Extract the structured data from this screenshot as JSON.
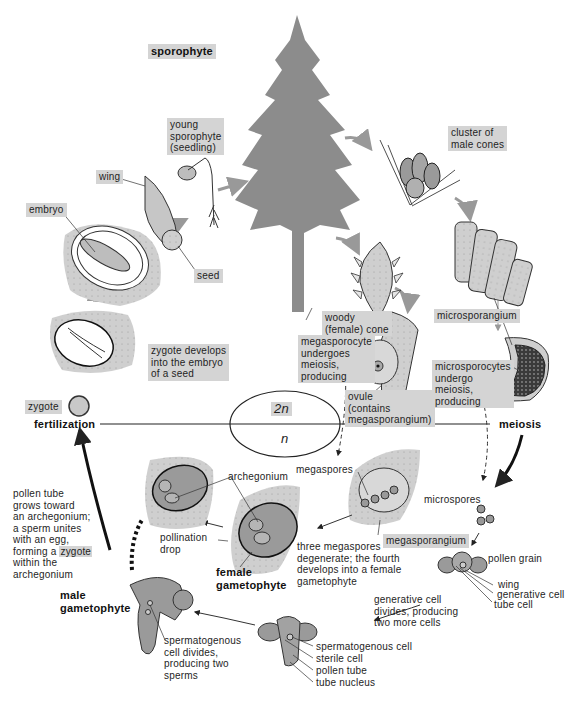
{
  "diagram": {
    "regions": {
      "diploid": "2n",
      "haploid": "n"
    },
    "stage_labels": {
      "sporophyte": "sporophyte",
      "fertilization": "fertilization",
      "meiosis": "meiosis",
      "male_gametophyte": "male\ngametophyte",
      "female_gametophyte": "female\ngametophyte"
    },
    "labels": {
      "young_sporophyte": "young\nsporophyte\n(seedling)",
      "wing_seed": "wing",
      "embryo": "embryo",
      "seed": "seed",
      "cluster_male_cones": "cluster of\nmale cones",
      "woody_cone": "woody\n(female) cone",
      "microsporangium": "microsporangium",
      "megasporocyte": "megasporocyte\nundergoes\nmeiosis,\nproducing",
      "ovule": "ovule\n(contains\nmegasporangium)",
      "microsporocytes": "microsporocytes\nundergo\nmeiosis,\nproducing",
      "zygote_develops": "zygote develops\ninto the embryo\nof a seed",
      "zygote": "zygote",
      "megaspores": "megaspores",
      "megasporangium": "megasporangium",
      "three_megaspores": "three megaspores\ndegenerate; the fourth\ndevelops into a female\ngametophyte",
      "microspores": "microspores",
      "pollen_grain": "pollen grain",
      "wing_pollen": "wing",
      "generative_cell": "generative cell",
      "tube_cell": "tube cell",
      "generative_divides": "generative cell\ndivides, producing\ntwo more cells",
      "archegonium": "archegonium",
      "pollination_drop": "pollination\ndrop",
      "pollen_tube_text_1": "pollen tube\ngrows toward\nan archegonium;\na sperm unites\nwith an egg,\nforming a ",
      "pollen_tube_zygote": "zygote",
      "pollen_tube_text_2": "\nwithin the\narchegonium",
      "spermatogenous_divides": "spermatogenous\ncell divides,\nproducing two\nsperms",
      "spermatogenous_cell": "spermatogenous cell",
      "sterile_cell": "sterile cell",
      "pollen_tube": "pollen tube",
      "tube_nucleus": "tube nucleus"
    },
    "colors": {
      "label_box": "#d4d4d4",
      "tree": "#8c8c8c",
      "tissue": "#c8c8c8",
      "dark_tissue": "#9a9a9a",
      "line": "#222222"
    }
  }
}
